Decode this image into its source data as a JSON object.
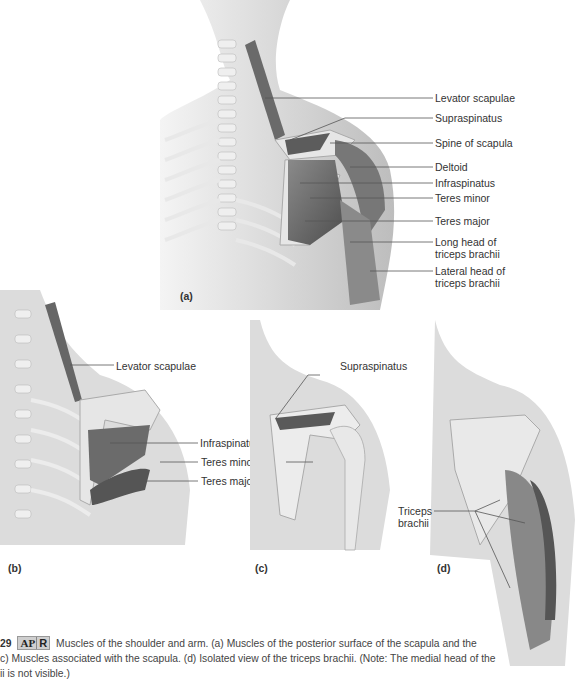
{
  "figure": {
    "panels": {
      "a": {
        "id_label": "(a)",
        "labels": [
          "Levator scapulae",
          "Supraspinatus",
          "Spine of scapula",
          "Deltoid",
          "Infraspinatus",
          "Teres minor",
          "Teres major",
          "Long head of triceps brachii",
          "Lateral head of triceps brachii"
        ],
        "label_lines": {
          "long_head_1": "Long head of",
          "long_head_2": "triceps brachii",
          "lateral_head_1": "Lateral head of",
          "lateral_head_2": "triceps brachii"
        }
      },
      "b": {
        "id_label": "(b)",
        "labels": [
          "Levator scapulae",
          "Infraspinatus",
          "Teres minor",
          "Teres major"
        ]
      },
      "c": {
        "id_label": "(c)",
        "labels": [
          "Supraspinatus"
        ]
      },
      "d": {
        "id_label": "(d)",
        "labels": [
          "Triceps brachii"
        ],
        "label_lines": {
          "line1": "Triceps",
          "line2": "brachii"
        }
      }
    },
    "caption": {
      "figure_number": "29",
      "badge_ap": "AP",
      "badge_r": "R",
      "line1": "Muscles of the shoulder and arm. (a) Muscles of the posterior surface of the scapula and the",
      "line2": "c) Muscles associated with the scapula. (d) Isolated view of the triceps brachii. (Note: The medial head of the",
      "line3": "ii is not visible.)"
    }
  }
}
